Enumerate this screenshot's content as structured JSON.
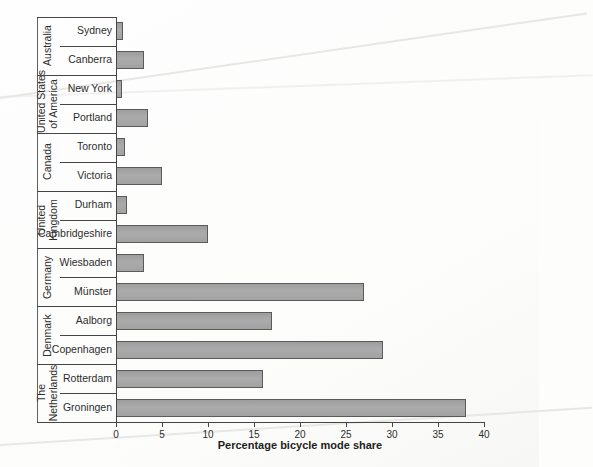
{
  "page": {
    "background": "#fdfdfc",
    "description_colors": {
      "bar_fill": "#a5a5a5",
      "bar_border": "#5a5a5a",
      "line": "#454545",
      "text": "#2d2d2d"
    }
  },
  "chart_data": {
    "type": "bar",
    "orientation": "horizontal",
    "title": "",
    "xlabel": "Percentage bicycle mode share",
    "ylabel": "",
    "xlim": [
      0,
      40
    ],
    "xticks": [
      0,
      5,
      10,
      15,
      20,
      25,
      30,
      35,
      40
    ],
    "grid": false,
    "legend": "none",
    "groups": [
      {
        "country": "Australia",
        "country_lines": [
          "Australia"
        ],
        "cities": [
          {
            "label": "Sydney",
            "value": 0.8
          },
          {
            "label": "Canberra",
            "value": 3
          }
        ]
      },
      {
        "country": "United States of America",
        "country_lines": [
          "United States",
          "of America"
        ],
        "cities": [
          {
            "label": "New York",
            "value": 0.6
          },
          {
            "label": "Portland",
            "value": 3.5
          }
        ]
      },
      {
        "country": "Canada",
        "country_lines": [
          "Canada"
        ],
        "cities": [
          {
            "label": "Toronto",
            "value": 1
          },
          {
            "label": "Victoria",
            "value": 5
          }
        ]
      },
      {
        "country": "United Kingdom",
        "country_lines": [
          "United",
          "Kingdom"
        ],
        "cities": [
          {
            "label": "Durham",
            "value": 1.2
          },
          {
            "label": "Cambridgeshire",
            "value": 10
          }
        ]
      },
      {
        "country": "Germany",
        "country_lines": [
          "Germany"
        ],
        "cities": [
          {
            "label": "Wiesbaden",
            "value": 3
          },
          {
            "label": "Münster",
            "value": 27
          }
        ]
      },
      {
        "country": "Denmark",
        "country_lines": [
          "Denmark"
        ],
        "cities": [
          {
            "label": "Aalborg",
            "value": 17
          },
          {
            "label": "Copenhagen",
            "value": 29
          }
        ]
      },
      {
        "country": "The Netherlands",
        "country_lines": [
          "The",
          "Netherlands"
        ],
        "cities": [
          {
            "label": "Rotterdam",
            "value": 16
          },
          {
            "label": "Groningen",
            "value": 38
          }
        ]
      }
    ]
  }
}
